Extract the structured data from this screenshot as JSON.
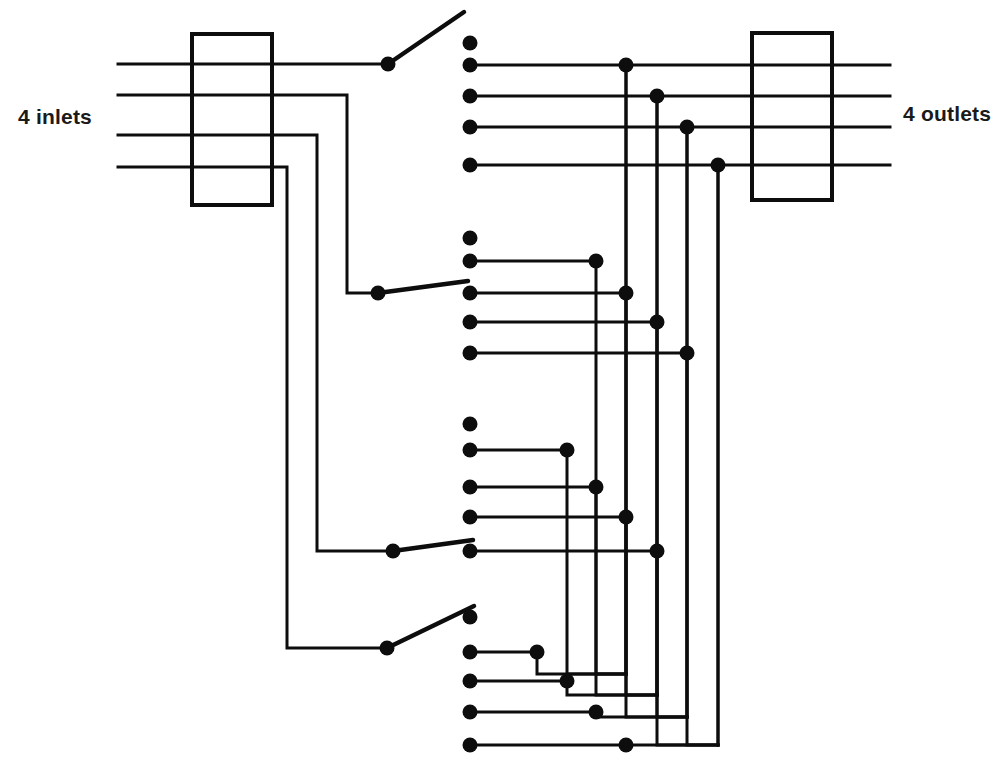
{
  "diagram": {
    "labels": {
      "inlets": "4 inlets",
      "outlets": "4 outlets"
    },
    "colors": {
      "line": "#0d0d0d",
      "background": "#ffffff",
      "text": "#1a1a1a"
    },
    "canvas": {
      "width": 1005,
      "height": 769
    },
    "geometry": {
      "line_width": 3,
      "box_line_width": 4,
      "contact_radius": 7.5,
      "junction_radius": 7.5,
      "pivot_radius": 7.5
    },
    "terminal_boxes": [
      {
        "name": "inlet-terminal-box",
        "x": 192,
        "y": 34,
        "width": 80,
        "height": 171
      },
      {
        "name": "outlet-terminal-box",
        "x": 752,
        "y": 33,
        "width": 80,
        "height": 167
      }
    ],
    "inlets": [
      {
        "index": 1,
        "y": 64,
        "x_start": 118,
        "turn_x": null,
        "pivot_x": 388,
        "pivot_y": 64
      },
      {
        "index": 2,
        "y": 95,
        "x_start": 118,
        "turn_x": 347,
        "pivot_x": 378,
        "pivot_y": 293
      },
      {
        "index": 3,
        "y": 135,
        "x_start": 118,
        "turn_x": 317,
        "pivot_x": 393,
        "pivot_y": 551
      },
      {
        "index": 4,
        "y": 167,
        "x_start": 118,
        "turn_x": 287,
        "pivot_x": 387,
        "pivot_y": 648
      }
    ],
    "outlets": [
      {
        "index": 1,
        "y": 65,
        "x_start": 626,
        "x_end": 890
      },
      {
        "index": 2,
        "y": 96,
        "x_start": 657,
        "x_end": 890
      },
      {
        "index": 3,
        "y": 127,
        "x_start": 687,
        "x_end": 890
      },
      {
        "index": 4,
        "y": 165,
        "x_start": 718,
        "x_end": 890
      }
    ],
    "bus_x": [
      626,
      657,
      687,
      718
    ],
    "bus_bottom_y": [
      674,
      695,
      717,
      745
    ],
    "contact_x": 470,
    "switch_groups": [
      {
        "name": "switch-group-1",
        "pivot": {
          "x": 388,
          "y": 64
        },
        "blade_tip": {
          "x": 464,
          "y": 12
        },
        "rest_contact": {
          "x": 470,
          "y": 43
        },
        "contacts": [
          {
            "outlet": 1,
            "y": 65,
            "bus_x": 626
          },
          {
            "outlet": 2,
            "y": 96,
            "bus_x": 657
          },
          {
            "outlet": 3,
            "y": 127,
            "bus_x": 687
          },
          {
            "outlet": 4,
            "y": 165,
            "bus_x": 718
          }
        ]
      },
      {
        "name": "switch-group-2",
        "pivot": {
          "x": 378,
          "y": 293
        },
        "blade_tip": {
          "x": 468,
          "y": 281
        },
        "rest_contact": {
          "x": 470,
          "y": 238
        },
        "contacts": [
          {
            "outlet": 1,
            "y": 261,
            "bus_x": 596
          },
          {
            "outlet": 2,
            "y": 293,
            "bus_x": 626
          },
          {
            "outlet": 3,
            "y": 322,
            "bus_x": 657
          },
          {
            "outlet": 4,
            "y": 353,
            "bus_x": 687
          }
        ]
      },
      {
        "name": "switch-group-3",
        "pivot": {
          "x": 393,
          "y": 551
        },
        "blade_tip": {
          "x": 473,
          "y": 540
        },
        "rest_contact": {
          "x": 470,
          "y": 424
        },
        "contacts": [
          {
            "outlet": 1,
            "y": 450,
            "bus_x": 567
          },
          {
            "outlet": 2,
            "y": 487,
            "bus_x": 596
          },
          {
            "outlet": 3,
            "y": 517,
            "bus_x": 626
          },
          {
            "outlet": 4,
            "y": 551,
            "bus_x": 657
          }
        ]
      },
      {
        "name": "switch-group-4",
        "pivot": {
          "x": 387,
          "y": 648
        },
        "blade_tip": {
          "x": 474,
          "y": 606
        },
        "rest_contact": {
          "x": 470,
          "y": 617
        },
        "contacts": [
          {
            "outlet": 1,
            "y": 652,
            "bus_x": 537
          },
          {
            "outlet": 2,
            "y": 681,
            "bus_x": 567
          },
          {
            "outlet": 3,
            "y": 712,
            "bus_x": 596
          },
          {
            "outlet": 4,
            "y": 745,
            "bus_x": 626
          }
        ]
      }
    ],
    "bus_segments": [
      {
        "name": "bus-1-outlet1",
        "from_x": 626,
        "from_y": 65,
        "to_y": 674,
        "wrap_to_x": 626
      },
      {
        "name": "bus-2-outlet2",
        "from_x": 657,
        "from_y": 96,
        "to_y": 695,
        "wrap_to_x": 657
      },
      {
        "name": "bus-3-outlet3",
        "from_x": 687,
        "from_y": 127,
        "to_y": 717,
        "wrap_to_x": 687
      },
      {
        "name": "bus-4-outlet4",
        "from_x": 718,
        "from_y": 165,
        "to_y": 745,
        "wrap_to_x": 718
      }
    ],
    "riser_x": [
      537,
      567,
      596,
      626,
      657,
      687,
      718
    ]
  }
}
